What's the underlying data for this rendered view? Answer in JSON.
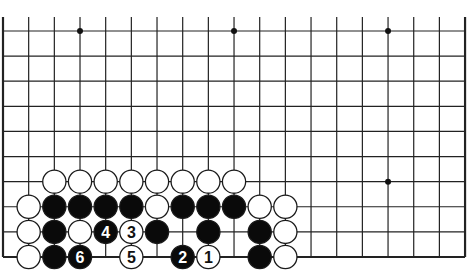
{
  "diagram": {
    "type": "go-board-partial",
    "title": "",
    "grid": {
      "columns": 19,
      "rows": 10,
      "x0": 3,
      "y0": 31,
      "dx": 25.67,
      "dy": 25.11,
      "edges": {
        "left": true,
        "right": true,
        "bottom": true,
        "top": false
      },
      "line_color": "#222222"
    },
    "star_points": [
      {
        "col": 3,
        "row": 0
      },
      {
        "col": 9,
        "row": 0
      },
      {
        "col": 15,
        "row": 0
      },
      {
        "col": 15,
        "row": 6
      }
    ],
    "stones": [
      {
        "col": 2,
        "row": 6,
        "color": "white"
      },
      {
        "col": 3,
        "row": 6,
        "color": "white"
      },
      {
        "col": 4,
        "row": 6,
        "color": "white"
      },
      {
        "col": 5,
        "row": 6,
        "color": "white"
      },
      {
        "col": 6,
        "row": 6,
        "color": "white"
      },
      {
        "col": 7,
        "row": 6,
        "color": "white"
      },
      {
        "col": 8,
        "row": 6,
        "color": "white"
      },
      {
        "col": 9,
        "row": 6,
        "color": "white"
      },
      {
        "col": 1,
        "row": 7,
        "color": "white"
      },
      {
        "col": 2,
        "row": 7,
        "color": "black"
      },
      {
        "col": 3,
        "row": 7,
        "color": "black"
      },
      {
        "col": 4,
        "row": 7,
        "color": "black"
      },
      {
        "col": 5,
        "row": 7,
        "color": "black"
      },
      {
        "col": 6,
        "row": 7,
        "color": "white"
      },
      {
        "col": 7,
        "row": 7,
        "color": "black"
      },
      {
        "col": 8,
        "row": 7,
        "color": "black"
      },
      {
        "col": 9,
        "row": 7,
        "color": "black"
      },
      {
        "col": 10,
        "row": 7,
        "color": "white"
      },
      {
        "col": 11,
        "row": 7,
        "color": "white"
      },
      {
        "col": 1,
        "row": 8,
        "color": "white"
      },
      {
        "col": 2,
        "row": 8,
        "color": "black"
      },
      {
        "col": 3,
        "row": 8,
        "color": "white"
      },
      {
        "col": 4,
        "row": 8,
        "color": "black",
        "label": "4"
      },
      {
        "col": 5,
        "row": 8,
        "color": "white",
        "label": "3"
      },
      {
        "col": 6,
        "row": 8,
        "color": "black"
      },
      {
        "col": 8,
        "row": 8,
        "color": "black"
      },
      {
        "col": 10,
        "row": 8,
        "color": "black"
      },
      {
        "col": 11,
        "row": 8,
        "color": "white"
      },
      {
        "col": 1,
        "row": 9,
        "color": "white"
      },
      {
        "col": 2,
        "row": 9,
        "color": "black"
      },
      {
        "col": 3,
        "row": 9,
        "color": "black",
        "label": "6"
      },
      {
        "col": 5,
        "row": 9,
        "color": "white",
        "label": "5"
      },
      {
        "col": 7,
        "row": 9,
        "color": "black",
        "label": "2"
      },
      {
        "col": 8,
        "row": 9,
        "color": "white",
        "label": "1"
      },
      {
        "col": 10,
        "row": 9,
        "color": "black"
      },
      {
        "col": 11,
        "row": 9,
        "color": "white"
      }
    ],
    "colors": {
      "black_stone": "#0a0a0a",
      "white_stone": "#ffffff",
      "stone_outline": "#1a1a1a",
      "background": "#ffffff"
    }
  }
}
